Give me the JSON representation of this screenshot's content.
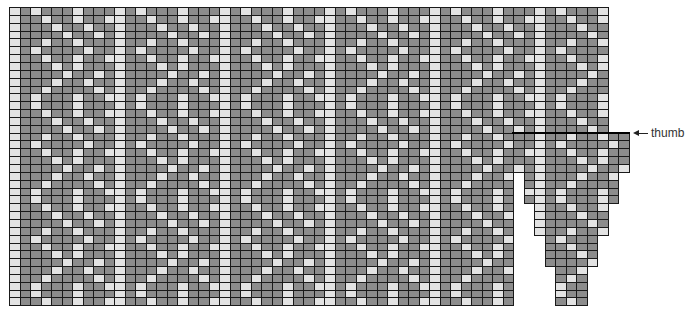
{
  "chart_data": {
    "type": "heatmap",
    "title": "",
    "colors": {
      "dark": "#8c8c8c",
      "light": "#e3e3e3",
      "grid": "#1a1a1a"
    },
    "grid": {
      "origin_x": 9,
      "origin_y": 7,
      "cell_w": 10.5,
      "cell_h": 7.85
    },
    "sections": [
      {
        "name": "main-upper",
        "col_start": 0,
        "cols": 57,
        "row_start": 0,
        "rows": 16
      },
      {
        "name": "main-lower",
        "col_start": 0,
        "cols": 48,
        "row_start": 16,
        "rows": 22
      },
      {
        "name": "thumb-tier-1",
        "col_start": 48,
        "cols": 11,
        "row_start": 16,
        "rows": 5
      },
      {
        "name": "thumb-tier-2",
        "col_start": 49,
        "cols": 9,
        "row_start": 21,
        "rows": 4
      },
      {
        "name": "thumb-tier-3",
        "col_start": 50,
        "cols": 7,
        "row_start": 25,
        "rows": 4
      },
      {
        "name": "thumb-tier-4",
        "col_start": 51,
        "cols": 5,
        "row_start": 29,
        "rows": 4
      },
      {
        "name": "thumb-tier-5",
        "col_start": 52,
        "cols": 3,
        "row_start": 33,
        "rows": 5
      }
    ],
    "pattern": {
      "repeat_cols": 10,
      "repeat_rows": 12,
      "rows": [
        "LDLDDDLDDD",
        "LDDLDDLDDL",
        "LDDDLDDLDD",
        "LDDDDLDDLD",
        "LDDLDDLDDD",
        "LDLDDDDLDD",
        "LDDLDDLDDL",
        "LDDDLDLDDD",
        "LDDDDLDDLD",
        "LDDDLDDLDD",
        "LDDLDDDDLD",
        "LDLDDDLDDL"
      ]
    },
    "annotations": [
      {
        "text": "thumb",
        "arrow": "left",
        "x": 632,
        "y": 133
      }
    ]
  },
  "labels": {
    "thumb": "thumb"
  }
}
